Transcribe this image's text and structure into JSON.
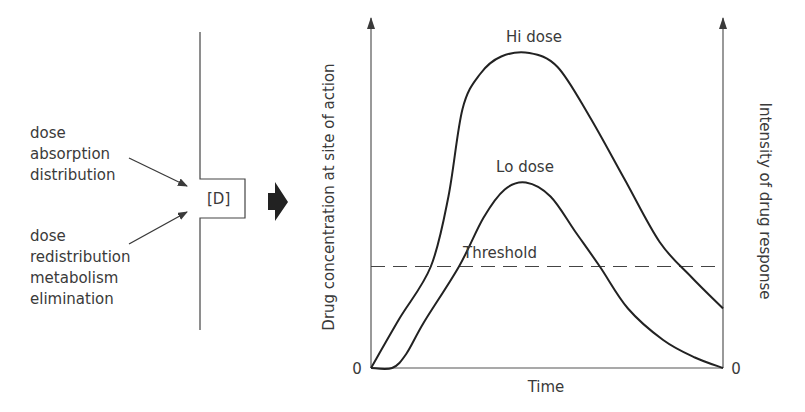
{
  "left_panel": {
    "input_labels": [
      "dose",
      "absorption",
      "distribution"
    ],
    "output_labels": [
      "dose",
      "redistribution",
      "metabolism",
      "elimination"
    ],
    "compartment_label": "[D]"
  },
  "chart_data": {
    "type": "line",
    "title": "",
    "xlabel": "Time",
    "ylabel_left": "Drug concentration at site of action",
    "ylabel_right": "Intensity of drug response",
    "x_origin_label": "0",
    "y_origin_label_left": "0",
    "y_origin_label_right": "0",
    "xlim": [
      0,
      1
    ],
    "ylim": [
      0,
      1
    ],
    "grid": false,
    "threshold": {
      "name": "Threshold",
      "value": 0.29
    },
    "series": [
      {
        "name": "Hi dose",
        "x": [
          0.0,
          0.08,
          0.17,
          0.22,
          0.26,
          0.31,
          0.37,
          0.45,
          0.53,
          0.62,
          0.72,
          0.82,
          0.91,
          1.0
        ],
        "y": [
          0.0,
          0.14,
          0.29,
          0.49,
          0.74,
          0.84,
          0.89,
          0.9,
          0.86,
          0.72,
          0.54,
          0.36,
          0.26,
          0.17
        ]
      },
      {
        "name": "Lo dose",
        "x": [
          0.0,
          0.06,
          0.1,
          0.15,
          0.25,
          0.32,
          0.38,
          0.44,
          0.51,
          0.58,
          0.65,
          0.73,
          0.83,
          0.92,
          1.0
        ],
        "y": [
          0.0,
          0.0,
          0.04,
          0.13,
          0.29,
          0.43,
          0.51,
          0.53,
          0.49,
          0.39,
          0.29,
          0.17,
          0.08,
          0.03,
          0.0
        ]
      }
    ]
  }
}
